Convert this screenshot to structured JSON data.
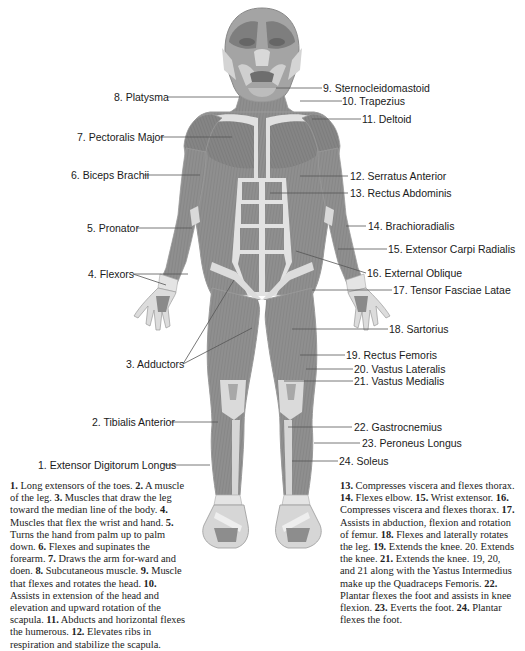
{
  "diagram": {
    "colors": {
      "muscle": "#8e8e8e",
      "muscle_dark": "#6f6f6f",
      "tendon": "#e2e2e2",
      "outline": "#9a9a9a",
      "leader_line": "#555555",
      "text": "#1a1a1a"
    },
    "labels": [
      {
        "id": 1,
        "text": "1. Extensor Digitorum Longus",
        "side": "left"
      },
      {
        "id": 2,
        "text": "2. Tibialis Anterior",
        "side": "left"
      },
      {
        "id": 3,
        "text": "3. Adductors",
        "side": "left"
      },
      {
        "id": 4,
        "text": "4. Flexors",
        "side": "left"
      },
      {
        "id": 5,
        "text": "5. Pronator",
        "side": "left"
      },
      {
        "id": 6,
        "text": "6. Biceps Brachii",
        "side": "left"
      },
      {
        "id": 7,
        "text": "7. Pectoralis Major",
        "side": "left"
      },
      {
        "id": 8,
        "text": "8. Platysma",
        "side": "left"
      },
      {
        "id": 9,
        "text": "9. Sternocleidomastoid",
        "side": "right"
      },
      {
        "id": 10,
        "text": "10. Trapezius",
        "side": "right"
      },
      {
        "id": 11,
        "text": "11. Deltoid",
        "side": "right"
      },
      {
        "id": 12,
        "text": "12. Serratus Anterior",
        "side": "right"
      },
      {
        "id": 13,
        "text": "13. Rectus Abdominis",
        "side": "right"
      },
      {
        "id": 14,
        "text": "14. Brachioradialis",
        "side": "right"
      },
      {
        "id": 15,
        "text": "15. Extensor Carpi Radialis",
        "side": "right"
      },
      {
        "id": 16,
        "text": "16. External Oblique",
        "side": "right"
      },
      {
        "id": 17,
        "text": "17. Tensor Fasciae Latae",
        "side": "right"
      },
      {
        "id": 18,
        "text": "18. Sartorius",
        "side": "right"
      },
      {
        "id": 19,
        "text": "19. Rectus Femoris",
        "side": "right"
      },
      {
        "id": 20,
        "text": "20. Vastus Lateralis",
        "side": "right"
      },
      {
        "id": 21,
        "text": "21. Vastus Medialis",
        "side": "right"
      },
      {
        "id": 22,
        "text": "22. Gastrocnemius",
        "side": "right"
      },
      {
        "id": 23,
        "text": "23. Peroneus Longus",
        "side": "right"
      },
      {
        "id": 24,
        "text": "24.  Soleus",
        "side": "right"
      }
    ],
    "descriptions_left": [
      {
        "num": "1.",
        "text": " Long extensors of the toes. "
      },
      {
        "num": "2.",
        "text": " A muscle of the leg. "
      },
      {
        "num": "3.",
        "text": " Muscles that draw the leg toward the median line of the body. "
      },
      {
        "num": "4.",
        "text": " Muscles that flex the wrist and hand. "
      },
      {
        "num": "5.",
        "text": " Turns the hand from palm up to palm down. "
      },
      {
        "num": "6.",
        "text": " Flexes and supinates the forearm. "
      },
      {
        "num": "7.",
        "text": " Draws the arm for-ward and doen. "
      },
      {
        "num": "8.",
        "text": " Subcutaneous muscle. "
      },
      {
        "num": "9.",
        "text": " Muscle that flexes and rotates the head. "
      },
      {
        "num": "10.",
        "text": " Assists in extension of the head and elevation and upward rotation of the scapula. "
      },
      {
        "num": "11.",
        "text": " Abducts and horizontal flexes the humerous. "
      },
      {
        "num": "12.",
        "text": " Elevates ribs in respiration and stabilize the scapula."
      }
    ],
    "descriptions_right": [
      {
        "num": "13.",
        "text": " Compresses viscera and flexes thorax. "
      },
      {
        "num": "14.",
        "text": " Flexes elbow. "
      },
      {
        "num": "15.",
        "text": " Wrist extensor. "
      },
      {
        "num": "16.",
        "text": " Compresses viscera and flexes thorax. "
      },
      {
        "num": "17.",
        "text": " Assists in abduction, flexion and rotation of femur. "
      },
      {
        "num": "18.",
        "text": " Flexes and laterally rotates the leg. "
      },
      {
        "num": "19.",
        "text": " Extends the knee. 20. Extends the knee. "
      },
      {
        "num": "21.",
        "text": " Extends the knee. 19, 20, and 21 along with the Yastus Intermedius make up the Quadraceps Femoris. "
      },
      {
        "num": "22.",
        "text": " Plantar flexes the foot and assists in knee flexion. "
      },
      {
        "num": "23.",
        "text": " Everts the foot. "
      },
      {
        "num": "24.",
        "text": " Plantar flexes the foot."
      }
    ]
  }
}
